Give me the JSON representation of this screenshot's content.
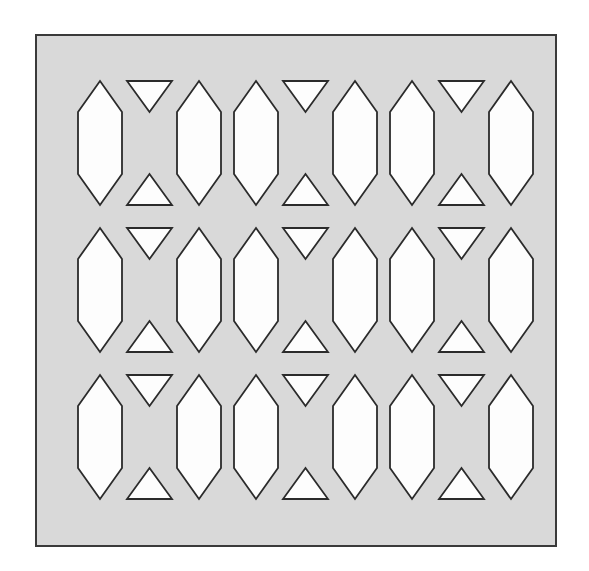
{
  "figure": {
    "canvas": {
      "width": 589,
      "height": 571
    },
    "background_color": "#ffffff"
  },
  "panel": {
    "name": "plate",
    "x": 36,
    "y": 35,
    "width": 520,
    "height": 511,
    "fill_color": "#d9d9d9",
    "stroke_color": "#3a3a3a",
    "stroke_width": 2
  },
  "shapes": {
    "fill_color": "#fdfdfd",
    "stroke_color": "#2b2b2b",
    "stroke_width": 1.8
  },
  "grid": {
    "rows": 3,
    "cols": 3,
    "origin_x": 78,
    "origin_y": 81,
    "pitch_x": 156,
    "pitch_y": 147
  },
  "unit_cell": {
    "width": 143,
    "height": 124,
    "hexagon": {
      "name": "hexagonal-void",
      "width": 44,
      "height": 124,
      "tip_inset": 31,
      "left_offset": 0,
      "right_offset": 99
    },
    "bowtie": {
      "name": "bowtie-void",
      "width": 45,
      "height": 124,
      "left_offset": 49,
      "triangle_height": 31,
      "upper_triangle": "apex-down",
      "lower_triangle": "apex-up"
    }
  },
  "cells": [
    {
      "row": 0,
      "col": 0,
      "name": "cell-r1-c1"
    },
    {
      "row": 0,
      "col": 1,
      "name": "cell-r1-c2"
    },
    {
      "row": 0,
      "col": 2,
      "name": "cell-r1-c3"
    },
    {
      "row": 1,
      "col": 0,
      "name": "cell-r2-c1"
    },
    {
      "row": 1,
      "col": 1,
      "name": "cell-r2-c2"
    },
    {
      "row": 1,
      "col": 2,
      "name": "cell-r2-c3"
    },
    {
      "row": 2,
      "col": 0,
      "name": "cell-r3-c1"
    },
    {
      "row": 2,
      "col": 1,
      "name": "cell-r3-c2"
    },
    {
      "row": 2,
      "col": 2,
      "name": "cell-r3-c3"
    }
  ]
}
